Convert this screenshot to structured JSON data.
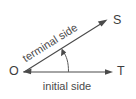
{
  "figure": {
    "background_color": "#ffffff",
    "line_color": "#4a4a4a",
    "text_color": "#4a4a4a",
    "width": 136,
    "height": 99
  },
  "labels": {
    "vertex": "O",
    "terminal_endpoint": "S",
    "initial_endpoint": "T",
    "terminal_side": "terminal side",
    "initial_side": "initial side"
  },
  "geometry": {
    "vertex_x": 24,
    "vertex_y": 72,
    "terminal_tip_x": 107,
    "terminal_tip_y": 20,
    "initial_tip_x": 113,
    "initial_tip_y": 72,
    "terminal_angle_deg": -32,
    "arc_start_x": 68,
    "arc_start_y": 72,
    "arc_end_x": 62,
    "arc_end_y": 50
  }
}
